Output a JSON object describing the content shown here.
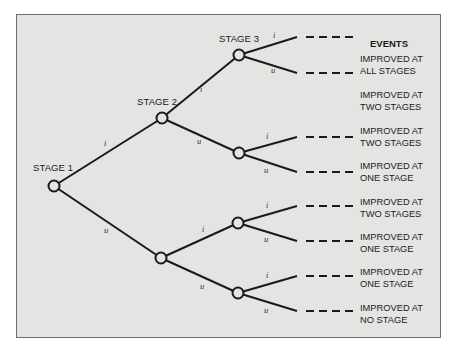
{
  "diagram": {
    "type": "event-tree",
    "stage_labels": [
      "STAGE 1",
      "STAGE 2",
      "STAGE 3"
    ],
    "branch_labels": {
      "improved": "i",
      "unimproved": "u"
    },
    "events_header": "EVENTS",
    "events": [
      {
        "line1": "IMPROVED AT",
        "line2": "ALL STAGES"
      },
      {
        "line1": "IMPROVED AT",
        "line2": "TWO STAGES"
      },
      {
        "line1": "IMPROVED AT",
        "line2": "TWO STAGES"
      },
      {
        "line1": "IMPROVED AT",
        "line2": "ONE STAGE"
      },
      {
        "line1": "IMPROVED AT",
        "line2": "TWO STAGES"
      },
      {
        "line1": "IMPROVED AT",
        "line2": "ONE STAGE"
      },
      {
        "line1": "IMPROVED AT",
        "line2": "ONE STAGE"
      },
      {
        "line1": "IMPROVED AT",
        "line2": "NO STAGE"
      }
    ],
    "colors": {
      "background": "#e4e4e3",
      "line": "#1a1a1a",
      "frame_border": "#6e6e6e"
    }
  }
}
